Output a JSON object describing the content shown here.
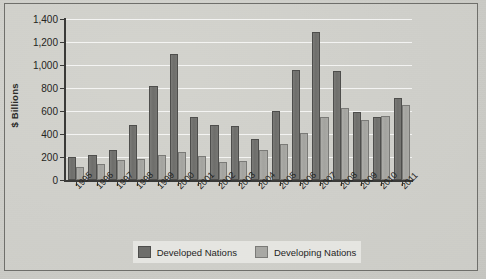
{
  "chart_data": {
    "type": "bar",
    "title": "",
    "xlabel": "",
    "ylabel": "$ Billions",
    "ylim": [
      0,
      1400
    ],
    "ytick_values": [
      0,
      200,
      400,
      600,
      800,
      1000,
      1200,
      1400
    ],
    "ytick_labels": [
      "0",
      "200",
      "400",
      "600",
      "800",
      "1,000",
      "1,200",
      "1,400"
    ],
    "grid": true,
    "legend_position": "bottom",
    "categories": [
      "1995",
      "1996",
      "1997",
      "1998",
      "1999",
      "2000",
      "2001",
      "2002",
      "2003",
      "2004",
      "2005",
      "2006",
      "2007",
      "2008",
      "2009",
      "2010",
      "2011"
    ],
    "series": [
      {
        "name": "Developed Nations",
        "color": "#6e6e6b",
        "values": [
          200,
          215,
          265,
          480,
          820,
          1100,
          550,
          480,
          470,
          355,
          600,
          960,
          1290,
          945,
          595,
          550,
          715
        ]
      },
      {
        "name": "Developing Nations",
        "color": "#a8a8a4",
        "values": [
          110,
          140,
          170,
          185,
          220,
          240,
          210,
          155,
          165,
          265,
          310,
          410,
          545,
          630,
          525,
          555,
          650
        ]
      }
    ]
  }
}
